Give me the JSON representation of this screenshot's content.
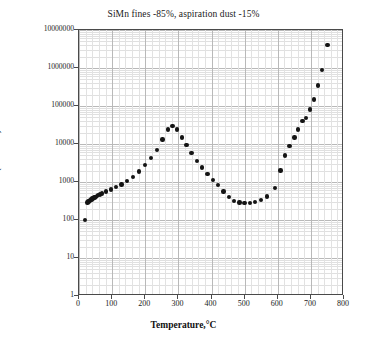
{
  "chart_data": {
    "type": "scatter",
    "title": "SiMn fines -85%, aspiration dust -15%",
    "xlabel": "Temperature,°C",
    "ylabel": "σ, (MOm·m)⁻¹",
    "xlim": [
      0,
      800
    ],
    "ylim": [
      1,
      10000000
    ],
    "yscale": "log",
    "xscale": "linear",
    "grid": true,
    "legend": false,
    "xticks": [
      0,
      100,
      200,
      300,
      400,
      500,
      600,
      700,
      800
    ],
    "xtick_labels": [
      "0",
      "100",
      "200",
      "300",
      "400",
      "500",
      "600",
      "700",
      "800"
    ],
    "yticks": [
      1,
      10,
      100,
      1000,
      10000,
      100000,
      1000000,
      10000000
    ],
    "ytick_labels": [
      "1",
      "10",
      "100",
      "1000",
      "10000",
      "100000",
      "1000000",
      "10000000"
    ],
    "x": [
      20,
      30,
      35,
      40,
      45,
      50,
      55,
      60,
      65,
      72,
      80,
      90,
      100,
      115,
      130,
      145,
      160,
      175,
      190,
      205,
      225,
      245,
      265,
      285,
      300,
      315,
      330,
      350,
      370,
      390,
      405,
      420,
      435,
      450,
      465,
      480,
      495,
      510,
      525,
      545,
      565,
      590,
      605,
      620,
      635,
      650,
      660,
      672,
      685,
      695,
      705,
      718,
      730,
      750
    ],
    "y": [
      100,
      310,
      330,
      345,
      360,
      375,
      390,
      405,
      420,
      440,
      470,
      520,
      600,
      700,
      800,
      950,
      1150,
      1500,
      2100,
      3000,
      4800,
      8000,
      15000,
      26000,
      30000,
      22000,
      14000,
      8500,
      5000,
      3000,
      2200,
      1500,
      1100,
      800,
      520,
      360,
      300,
      285,
      285,
      300,
      330,
      420,
      700,
      1800,
      6000,
      12000,
      20000,
      32000,
      55000,
      80000,
      100000,
      180000,
      420000,
      1000000,
      4000000
    ],
    "series_note": "conductivity vs temperature"
  },
  "points": [
    {
      "x": 18,
      "y": 100
    },
    {
      "x": 26,
      "y": 290
    },
    {
      "x": 29,
      "y": 305
    },
    {
      "x": 32,
      "y": 320
    },
    {
      "x": 35,
      "y": 335
    },
    {
      "x": 38,
      "y": 350
    },
    {
      "x": 41,
      "y": 365
    },
    {
      "x": 44,
      "y": 380
    },
    {
      "x": 47,
      "y": 395
    },
    {
      "x": 50,
      "y": 410
    },
    {
      "x": 54,
      "y": 430
    },
    {
      "x": 58,
      "y": 450
    },
    {
      "x": 63,
      "y": 470
    },
    {
      "x": 70,
      "y": 500
    },
    {
      "x": 82,
      "y": 560
    },
    {
      "x": 97,
      "y": 640
    },
    {
      "x": 112,
      "y": 730
    },
    {
      "x": 128,
      "y": 860
    },
    {
      "x": 145,
      "y": 1050
    },
    {
      "x": 163,
      "y": 1350
    },
    {
      "x": 182,
      "y": 1900
    },
    {
      "x": 200,
      "y": 2800
    },
    {
      "x": 218,
      "y": 4300
    },
    {
      "x": 236,
      "y": 7000
    },
    {
      "x": 252,
      "y": 13000
    },
    {
      "x": 268,
      "y": 24000
    },
    {
      "x": 282,
      "y": 30000
    },
    {
      "x": 296,
      "y": 24000
    },
    {
      "x": 310,
      "y": 15000
    },
    {
      "x": 325,
      "y": 9500
    },
    {
      "x": 340,
      "y": 5800
    },
    {
      "x": 356,
      "y": 3600
    },
    {
      "x": 372,
      "y": 2400
    },
    {
      "x": 388,
      "y": 1600
    },
    {
      "x": 404,
      "y": 1150
    },
    {
      "x": 420,
      "y": 820
    },
    {
      "x": 436,
      "y": 560
    },
    {
      "x": 452,
      "y": 400
    },
    {
      "x": 468,
      "y": 320
    },
    {
      "x": 484,
      "y": 290
    },
    {
      "x": 500,
      "y": 280
    },
    {
      "x": 516,
      "y": 285
    },
    {
      "x": 532,
      "y": 300
    },
    {
      "x": 550,
      "y": 340
    },
    {
      "x": 568,
      "y": 420
    },
    {
      "x": 592,
      "y": 700
    },
    {
      "x": 608,
      "y": 2000
    },
    {
      "x": 622,
      "y": 5000
    },
    {
      "x": 636,
      "y": 9000
    },
    {
      "x": 650,
      "y": 15000
    },
    {
      "x": 662,
      "y": 24000
    },
    {
      "x": 675,
      "y": 40000
    },
    {
      "x": 686,
      "y": 48000
    },
    {
      "x": 697,
      "y": 80000
    },
    {
      "x": 709,
      "y": 150000
    },
    {
      "x": 722,
      "y": 350000
    },
    {
      "x": 734,
      "y": 900000
    },
    {
      "x": 750,
      "y": 4000000
    }
  ]
}
